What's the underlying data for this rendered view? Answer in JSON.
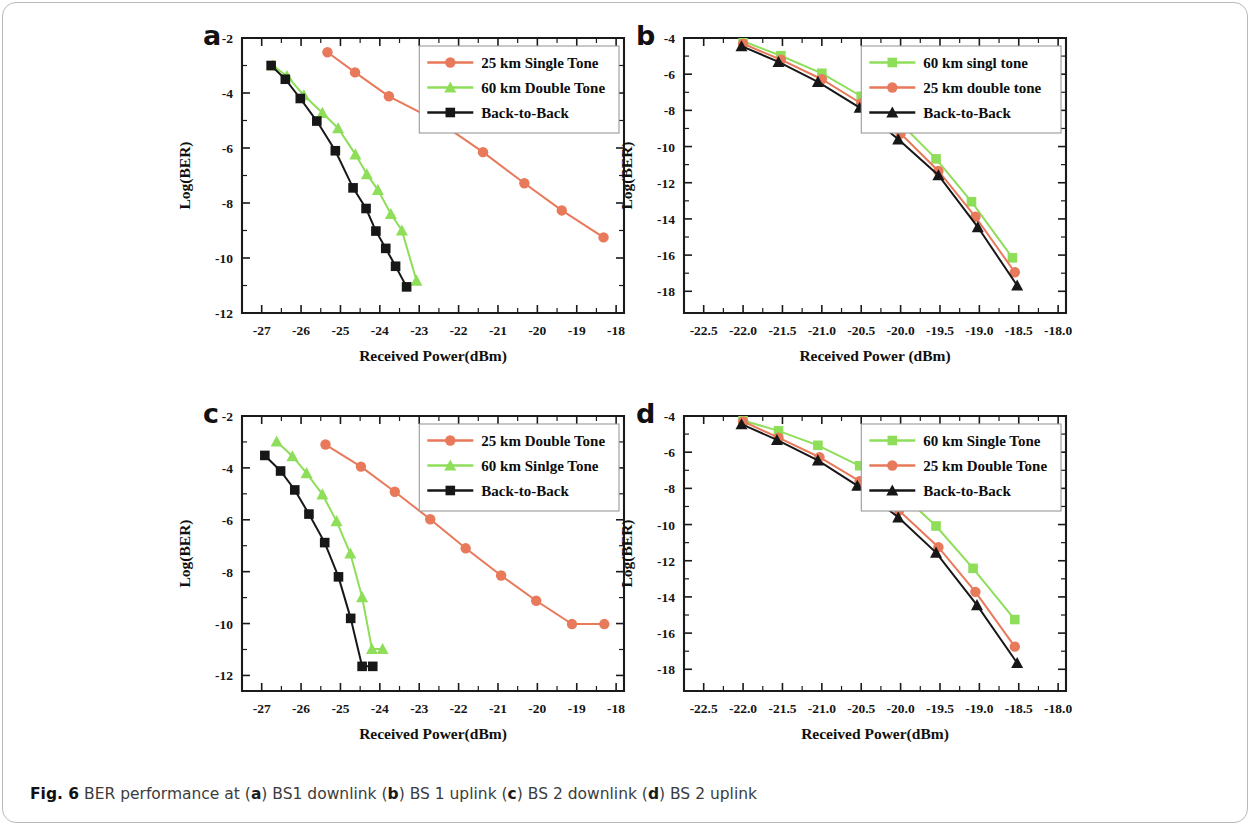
{
  "figure": {
    "label": "Fig. 6",
    "caption_parts": [
      {
        "text": "BER performance at (",
        "bold": false
      },
      {
        "text": "a",
        "bold": true
      },
      {
        "text": ") BS1 downlink (",
        "bold": false
      },
      {
        "text": "b",
        "bold": true
      },
      {
        "text": ") BS 1 uplink (",
        "bold": false
      },
      {
        "text": "c",
        "bold": true
      },
      {
        "text": ") BS 2 downlink (",
        "bold": false
      },
      {
        "text": "d",
        "bold": true
      },
      {
        "text": ") BS 2 uplink",
        "bold": false
      }
    ],
    "caption_plain": "BER performance at (a) BS1 downlink (b) BS 1 uplink (c) BS 2 downlink (d) BS 2 uplink"
  },
  "colors": {
    "salmon": "#e8795a",
    "green": "#8ede5a",
    "black": "#171717",
    "axis": "#1a1a1a",
    "legend_border": "#9a9a9a",
    "page_border": "#b9b9b9"
  },
  "panels": {
    "a": {
      "letter": "a"
    },
    "b": {
      "letter": "b"
    },
    "c": {
      "letter": "c"
    },
    "d": {
      "letter": "d"
    }
  },
  "chart_data": [
    {
      "id": "a",
      "panel_letter": "a",
      "type": "line",
      "title": "",
      "xlabel": "Received Power(dBm)",
      "ylabel": "Log(BER)",
      "xlim": [
        -27.5,
        -17.8
      ],
      "ylim": [
        -12,
        -2
      ],
      "xticks": [
        -27,
        -26,
        -25,
        -24,
        -23,
        -22,
        -21,
        -20,
        -19,
        -18
      ],
      "xtick_labels": [
        "-27",
        "-26",
        "-25",
        "-24",
        "-23",
        "-22",
        "-21",
        "-20",
        "-19",
        "-18"
      ],
      "yticks": [
        -2,
        -4,
        -6,
        -8,
        -10,
        -12
      ],
      "ytick_labels": [
        "-2",
        "-4",
        "-6",
        "-8",
        "-10",
        "-12"
      ],
      "grid": false,
      "legend_position": "top-right",
      "series": [
        {
          "name": "25 km Single Tone",
          "color": "#e8795a",
          "marker": "circle",
          "x": [
            -25.33,
            -24.63,
            -23.77,
            -22.47,
            -21.38,
            -20.33,
            -19.38,
            -18.32
          ],
          "y": [
            -2.52,
            -3.25,
            -4.12,
            -5.08,
            -6.15,
            -7.28,
            -8.27,
            -9.25
          ]
        },
        {
          "name": "60 km Double Tone",
          "color": "#8ede5a",
          "marker": "triangle",
          "x": [
            -26.72,
            -26.36,
            -25.93,
            -25.46,
            -25.06,
            -24.62,
            -24.33,
            -24.05,
            -23.72,
            -23.44,
            -23.07
          ],
          "y": [
            -3.0,
            -3.38,
            -4.08,
            -4.72,
            -5.28,
            -6.23,
            -6.95,
            -7.52,
            -8.4,
            -9.0,
            -10.82
          ]
        },
        {
          "name": "Back-to-Back",
          "color": "#171717",
          "marker": "square",
          "x": [
            -26.76,
            -26.4,
            -26.02,
            -25.6,
            -25.13,
            -24.68,
            -24.35,
            -24.1,
            -23.85,
            -23.6,
            -23.32
          ],
          "y": [
            -3.0,
            -3.5,
            -4.2,
            -5.02,
            -6.1,
            -7.45,
            -8.2,
            -9.02,
            -9.65,
            -10.3,
            -11.05
          ]
        }
      ]
    },
    {
      "id": "b",
      "panel_letter": "b",
      "type": "line",
      "title": "",
      "xlabel": "Received Power (dBm)",
      "ylabel": "Log(BER)",
      "xlim": [
        -22.75,
        -17.9
      ],
      "ylim": [
        -19.2,
        -4
      ],
      "xticks": [
        -22.5,
        -22.0,
        -21.5,
        -21.0,
        -20.5,
        -20.0,
        -19.5,
        -19.0,
        -18.5,
        -18.0
      ],
      "xtick_labels": [
        "-22.5",
        "-22.0",
        "-21.5",
        "-21.0",
        "-20.5",
        "-20.0",
        "-19.5",
        "-19.0",
        "-18.5",
        "-18.0"
      ],
      "yticks": [
        -4,
        -6,
        -8,
        -10,
        -12,
        -14,
        -16,
        -18
      ],
      "ytick_labels": [
        "-4",
        "-6",
        "-8",
        "-10",
        "-12",
        "-14",
        "-16",
        "-18"
      ],
      "grid": false,
      "legend_position": "top-right",
      "series": [
        {
          "name": "60 km singl tone",
          "color": "#8ede5a",
          "marker": "square",
          "x": [
            -22.0,
            -21.52,
            -21.0,
            -20.5,
            -20.0,
            -19.55,
            -19.1,
            -18.58
          ],
          "y": [
            -4.18,
            -4.98,
            -5.95,
            -7.22,
            -8.72,
            -10.68,
            -13.05,
            -16.15
          ]
        },
        {
          "name": "25 km double tone",
          "color": "#e8795a",
          "marker": "circle",
          "x": [
            -22.0,
            -21.52,
            -21.0,
            -20.5,
            -20.0,
            -19.52,
            -19.05,
            -18.55
          ],
          "y": [
            -4.32,
            -5.2,
            -6.28,
            -7.62,
            -9.28,
            -11.35,
            -13.88,
            -16.95
          ]
        },
        {
          "name": "Back-to-Back",
          "color": "#171717",
          "marker": "triangle",
          "x": [
            -22.02,
            -21.55,
            -21.05,
            -20.52,
            -20.03,
            -19.52,
            -19.02,
            -18.52
          ],
          "y": [
            -4.45,
            -5.32,
            -6.42,
            -7.85,
            -9.6,
            -11.58,
            -14.45,
            -17.68
          ]
        }
      ]
    },
    {
      "id": "c",
      "panel_letter": "c",
      "type": "line",
      "title": "",
      "xlabel": "Received Power(dBm)",
      "ylabel": "Log(BER)",
      "xlim": [
        -27.5,
        -17.8
      ],
      "ylim": [
        -12.6,
        -2
      ],
      "xticks": [
        -27,
        -26,
        -25,
        -24,
        -23,
        -22,
        -21,
        -20,
        -19,
        -18
      ],
      "xtick_labels": [
        "-27",
        "-26",
        "-25",
        "-24",
        "-23",
        "-22",
        "-21",
        "-20",
        "-19",
        "-18"
      ],
      "yticks": [
        -2,
        -4,
        -6,
        -8,
        -10,
        -12
      ],
      "ytick_labels": [
        "-2",
        "-4",
        "-6",
        "-8",
        "-10",
        "-12"
      ],
      "grid": false,
      "legend_position": "top-right",
      "series": [
        {
          "name": "25 km Double Tone",
          "color": "#e8795a",
          "marker": "circle",
          "x": [
            -25.38,
            -24.48,
            -23.62,
            -22.72,
            -21.82,
            -20.92,
            -20.03,
            -19.12,
            -18.3
          ],
          "y": [
            -3.1,
            -3.95,
            -4.92,
            -5.98,
            -7.1,
            -8.15,
            -9.12,
            -10.02,
            -10.02
          ]
        },
        {
          "name": "60 km Sinlge Tone",
          "color": "#8ede5a",
          "marker": "triangle",
          "x": [
            -26.62,
            -26.22,
            -25.86,
            -25.46,
            -25.1,
            -24.75,
            -24.45,
            -24.2,
            -23.93
          ],
          "y": [
            -2.98,
            -3.55,
            -4.2,
            -5.02,
            -6.05,
            -7.3,
            -8.98,
            -10.98,
            -10.98
          ]
        },
        {
          "name": "Back-to-Back",
          "color": "#171717",
          "marker": "square",
          "x": [
            -26.92,
            -26.52,
            -26.16,
            -25.8,
            -25.4,
            -25.05,
            -24.74,
            -24.45,
            -24.18
          ],
          "y": [
            -3.52,
            -4.12,
            -4.85,
            -5.78,
            -6.88,
            -8.2,
            -9.8,
            -11.65,
            -11.65
          ]
        }
      ]
    },
    {
      "id": "d",
      "panel_letter": "d",
      "type": "line",
      "title": "",
      "xlabel": "Received Power(dBm)",
      "ylabel": "Log(BER)",
      "xlim": [
        -22.75,
        -17.9
      ],
      "ylim": [
        -19.2,
        -4
      ],
      "xticks": [
        -22.5,
        -22.0,
        -21.5,
        -21.0,
        -20.5,
        -20.0,
        -19.5,
        -19.0,
        -18.5,
        -18.0
      ],
      "xtick_labels": [
        "-22.5",
        "-22.0",
        "-21.5",
        "-21.0",
        "-20.5",
        "-20.0",
        "-19.5",
        "-19.0",
        "-18.5",
        "-18.0"
      ],
      "yticks": [
        -4,
        -6,
        -8,
        -10,
        -12,
        -14,
        -16,
        -18
      ],
      "ytick_labels": [
        "-4",
        "-6",
        "-8",
        "-10",
        "-12",
        "-14",
        "-16",
        "-18"
      ],
      "grid": false,
      "legend_position": "top-right",
      "series": [
        {
          "name": "60 km Single Tone",
          "color": "#8ede5a",
          "marker": "square",
          "x": [
            -22.0,
            -21.55,
            -21.05,
            -20.52,
            -20.03,
            -19.55,
            -19.08,
            -18.55
          ],
          "y": [
            -4.25,
            -4.82,
            -5.62,
            -6.75,
            -8.15,
            -10.08,
            -12.42,
            -15.25
          ]
        },
        {
          "name": "25 km Double Tone",
          "color": "#e8795a",
          "marker": "circle",
          "x": [
            -22.0,
            -21.55,
            -21.03,
            -20.52,
            -20.02,
            -19.52,
            -19.05,
            -18.55
          ],
          "y": [
            -4.3,
            -5.2,
            -6.28,
            -7.6,
            -9.22,
            -11.25,
            -13.72,
            -16.75
          ]
        },
        {
          "name": "Back-to-Back",
          "color": "#171717",
          "marker": "triangle",
          "x": [
            -22.02,
            -21.57,
            -21.05,
            -20.55,
            -20.03,
            -19.55,
            -19.03,
            -18.52
          ],
          "y": [
            -4.45,
            -5.32,
            -6.45,
            -7.85,
            -9.6,
            -11.55,
            -14.45,
            -17.65
          ]
        }
      ]
    }
  ]
}
